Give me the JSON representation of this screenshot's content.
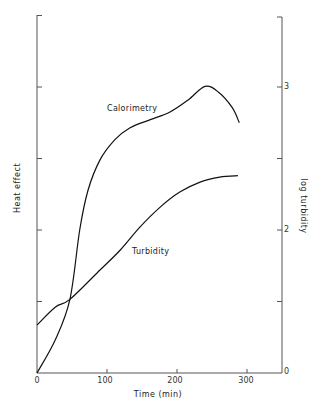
{
  "chart_data": {
    "type": "line",
    "title": "",
    "xlabel": "Time (min)",
    "ylabel": "Heat effect",
    "ylabel_right": "log turbidity",
    "xlim": [
      0,
      350
    ],
    "x_ticks": [
      0,
      100,
      200,
      300
    ],
    "x_tick_labels": [
      "0",
      "100",
      "200",
      "300"
    ],
    "ylim": [
      0,
      5
    ],
    "y_ticks_left": [
      0,
      1,
      2,
      3,
      4,
      5
    ],
    "y_tick_labels_left": [
      "",
      "",
      "",
      "",
      "",
      ""
    ],
    "y_ticks_right_positions": [
      0,
      1,
      2,
      3,
      4,
      5
    ],
    "y_tick_labels_right": [
      "0",
      "",
      "2",
      "",
      "3",
      ""
    ],
    "grid": false,
    "legend": "inline annotations",
    "series": [
      {
        "name": "Calorimetry",
        "axis": "left",
        "x": [
          0,
          26,
          47,
          61,
          73,
          90,
          111,
          133,
          161,
          190,
          216,
          240,
          259,
          279,
          289
        ],
        "y": [
          0,
          0.46,
          1.03,
          2.0,
          2.56,
          2.98,
          3.26,
          3.43,
          3.54,
          3.65,
          3.82,
          4.01,
          3.93,
          3.71,
          3.5
        ]
      },
      {
        "name": "Turbidity",
        "axis": "right",
        "x": [
          0,
          26,
          47,
          90,
          119,
          147,
          176,
          204,
          233,
          261,
          287
        ],
        "y": [
          0.67,
          0.92,
          1.03,
          1.44,
          1.72,
          2.04,
          2.32,
          2.53,
          2.67,
          2.74,
          2.76
        ]
      }
    ],
    "annotations": [
      {
        "text": "Calorimetry",
        "x": 100,
        "y": 3.7
      },
      {
        "text": "Turbidity",
        "x": 137,
        "y": 1.7
      }
    ]
  },
  "labels": {
    "xlabel": "Time (min)",
    "ylabel_left": "Heat effect",
    "ylabel_right": "log turbidity",
    "calorimetry": "Calorimetry",
    "turbidity": "Turbidity",
    "x0": "0",
    "x100": "100",
    "x200": "200",
    "x300": "300",
    "r0": "0",
    "r2": "2",
    "r3": "3"
  }
}
